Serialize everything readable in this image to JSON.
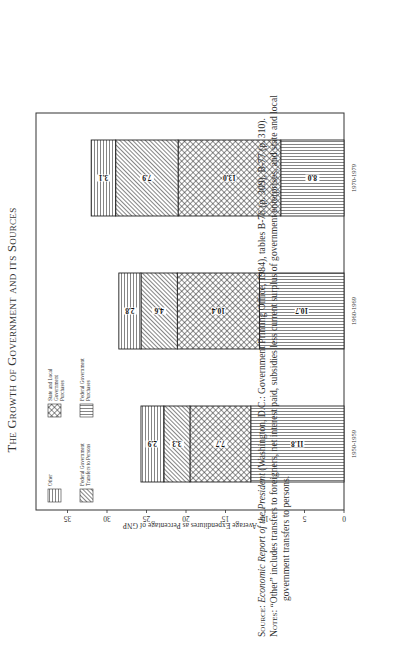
{
  "chart_data": {
    "type": "bar",
    "stacked": true,
    "title": "The Growth of Government and its Sources",
    "xlabel": "",
    "ylabel": "Average Expenditures as Percentage of GNP",
    "ylim": [
      0,
      35
    ],
    "yticks": [
      0,
      5,
      10,
      15,
      20,
      25,
      30,
      35
    ],
    "grid": false,
    "legend_position": "upper-left inside plot",
    "categories": [
      "1950-1959",
      "1960-1969",
      "1970-1979"
    ],
    "series": [
      {
        "name": "Federal Government Purchases",
        "pattern": "vertical-lines",
        "values": [
          11.8,
          10.7,
          8.0
        ]
      },
      {
        "name": "State and Local Government Purchases",
        "pattern": "crosshatch",
        "values": [
          7.7,
          10.4,
          13.0
        ]
      },
      {
        "name": "Federal Government Transfers to Persons",
        "pattern": "diagonal-lines",
        "values": [
          3.3,
          4.6,
          7.9
        ]
      },
      {
        "name": "Other",
        "pattern": "horizontal-lines",
        "values": [
          2.9,
          2.8,
          3.1
        ]
      }
    ],
    "totals": [
      25.7,
      28.5,
      32.0
    ]
  },
  "labels": {
    "title": "The Growth of Government and its Sources",
    "ylabel": "Average Expenditures as Percentage of GNP",
    "legend": {
      "other": "Other",
      "state_local": [
        "State and Local",
        "Government",
        "Purchases"
      ],
      "transfers": [
        "Federal Government",
        "Transfers to Persons"
      ],
      "fed_purchases": [
        "Federal Government",
        "Purchases"
      ]
    }
  },
  "caption": {
    "source_prefix": "Source:",
    "source_title": "Economic Report of the President",
    "source_rest": " (Washington, D.C.: Government Printing Office, 1984), tables B-76 (p. 309), B-77 (p. 310).",
    "notes_prefix": "Notes:",
    "notes_line1": " “Other” includes transfers to foreigners, net interest paid, subsidies less current surplus of government enterprises, and state and local",
    "notes_line2": "government transfers to persons."
  },
  "colors": {
    "ink": "#222222",
    "background": "#ffffff"
  }
}
